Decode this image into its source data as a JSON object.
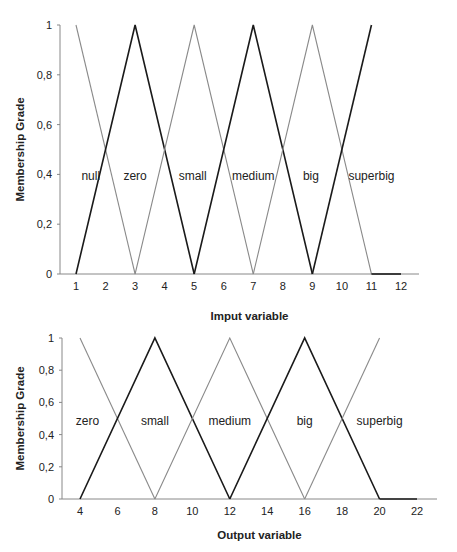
{
  "chart_data": [
    {
      "type": "line",
      "title": "",
      "xlabel": "Imput variable",
      "ylabel": "Membership Grade",
      "x_ticks": [
        "1",
        "2",
        "3",
        "4",
        "5",
        "6",
        "7",
        "8",
        "9",
        "10",
        "11",
        "12"
      ],
      "y_ticks": [
        "0",
        "0,2",
        "0,4",
        "0,6",
        "0,8",
        "1"
      ],
      "xlim": [
        1,
        12
      ],
      "ylim": [
        0,
        1
      ],
      "grid": false,
      "series": [
        {
          "name": "null",
          "color": "#8a8a8a",
          "points": [
            [
              1,
              1
            ],
            [
              3,
              0
            ]
          ]
        },
        {
          "name": "zero",
          "color": "#1a1a1a",
          "points": [
            [
              1,
              0
            ],
            [
              3,
              1
            ],
            [
              5,
              0
            ]
          ]
        },
        {
          "name": "small",
          "color": "#8a8a8a",
          "points": [
            [
              3,
              0
            ],
            [
              5,
              1
            ],
            [
              7,
              0
            ]
          ]
        },
        {
          "name": "medium",
          "color": "#1a1a1a",
          "points": [
            [
              5,
              0
            ],
            [
              7,
              1
            ],
            [
              9,
              0
            ]
          ]
        },
        {
          "name": "big",
          "color": "#8a8a8a",
          "points": [
            [
              7,
              0
            ],
            [
              9,
              1
            ],
            [
              11,
              0
            ]
          ]
        },
        {
          "name": "superbig",
          "color": "#1a1a1a",
          "points": [
            [
              9,
              0
            ],
            [
              11,
              1
            ]
          ]
        }
      ],
      "set_labels": [
        {
          "text": "null",
          "x": 1.5
        },
        {
          "text": "zero",
          "x": 3.0
        },
        {
          "text": "small",
          "x": 4.95
        },
        {
          "text": "medium",
          "x": 7.0
        },
        {
          "text": "big",
          "x": 8.95
        },
        {
          "text": "superbig",
          "x": 11.0
        }
      ],
      "baseline_extension": [
        [
          11,
          0
        ],
        [
          12,
          0
        ]
      ]
    },
    {
      "type": "line",
      "title": "",
      "xlabel": "Output variable",
      "ylabel": "Membership Grade",
      "x_ticks": [
        "4",
        "6",
        "8",
        "10",
        "12",
        "14",
        "16",
        "18",
        "20",
        "22"
      ],
      "y_ticks": [
        "0",
        "0,2",
        "0,4",
        "0,6",
        "0,8",
        "1"
      ],
      "xlim": [
        4,
        22
      ],
      "ylim": [
        0,
        1
      ],
      "grid": false,
      "series": [
        {
          "name": "zero",
          "color": "#8a8a8a",
          "points": [
            [
              4,
              1
            ],
            [
              8,
              0
            ]
          ]
        },
        {
          "name": "small",
          "color": "#1a1a1a",
          "points": [
            [
              4,
              0
            ],
            [
              8,
              1
            ],
            [
              12,
              0
            ]
          ]
        },
        {
          "name": "medium",
          "color": "#8a8a8a",
          "points": [
            [
              8,
              0
            ],
            [
              12,
              1
            ],
            [
              16,
              0
            ]
          ]
        },
        {
          "name": "big",
          "color": "#1a1a1a",
          "points": [
            [
              12,
              0
            ],
            [
              16,
              1
            ],
            [
              20,
              0
            ]
          ]
        },
        {
          "name": "superbig",
          "color": "#8a8a8a",
          "points": [
            [
              16,
              0
            ],
            [
              20,
              1
            ]
          ]
        }
      ],
      "set_labels": [
        {
          "text": "zero",
          "x": 4.4
        },
        {
          "text": "small",
          "x": 8.0
        },
        {
          "text": "medium",
          "x": 12.0
        },
        {
          "text": "big",
          "x": 16.0
        },
        {
          "text": "superbig",
          "x": 20.0
        }
      ],
      "baseline_extension": [
        [
          20,
          0
        ],
        [
          22,
          0
        ]
      ]
    }
  ]
}
